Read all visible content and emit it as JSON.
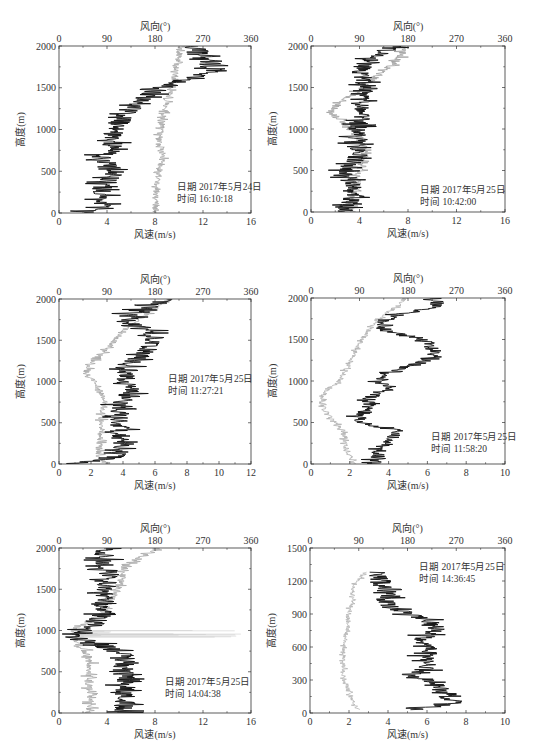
{
  "chart_data": [
    {
      "type": "line",
      "panel": 1,
      "title": "",
      "annotation": {
        "date": "日期 2017年5月24日",
        "time": "时间 16:10:18"
      },
      "xlabel": "风速(m/s)",
      "x2label": "风向(°)",
      "ylabel": "高度(m)",
      "xlim": [
        0,
        16
      ],
      "xticks": [
        0,
        4,
        8,
        12,
        16
      ],
      "x2lim": [
        0,
        360
      ],
      "x2ticks": [
        0,
        90,
        180,
        270,
        360
      ],
      "ylim": [
        0,
        2000
      ],
      "yticks": [
        0,
        500,
        1000,
        1500,
        2000
      ],
      "series": [
        {
          "name": "风速",
          "color": "#111111",
          "axis": "bottom",
          "heights": [
            0,
            100,
            200,
            300,
            400,
            500,
            600,
            700,
            800,
            900,
            1000,
            1100,
            1200,
            1300,
            1400,
            1500,
            1600,
            1700,
            1800,
            1900,
            2000
          ],
          "values": [
            2,
            3.8,
            3.8,
            3.6,
            4.2,
            4.6,
            4.0,
            3.8,
            4.4,
            4.6,
            4.6,
            5.2,
            5.8,
            6.2,
            7.2,
            8.6,
            10.5,
            12.8,
            13.0,
            12.0,
            11.0
          ],
          "noise": 1.1
        },
        {
          "name": "风向",
          "color": "#a8a8a8",
          "axis": "top",
          "heights": [
            0,
            100,
            200,
            300,
            400,
            500,
            600,
            700,
            800,
            900,
            1000,
            1100,
            1200,
            1300,
            1400,
            1500,
            1600,
            1700,
            1800,
            1900,
            2000
          ],
          "values": [
            180,
            180,
            182,
            184,
            185,
            188,
            192,
            195,
            190,
            188,
            190,
            195,
            198,
            200,
            205,
            210,
            215,
            218,
            220,
            225,
            225
          ],
          "noise": 8
        }
      ],
      "annotation_position": {
        "x": 9.8,
        "y": 280
      }
    },
    {
      "type": "line",
      "panel": 2,
      "annotation": {
        "date": "日期 2017年5月25日",
        "time": "时间 10:42:00"
      },
      "xlabel": "风速(m/s)",
      "x2label": "风向(°)",
      "ylabel": "高度(m)",
      "xlim": [
        0,
        16
      ],
      "xticks": [
        0,
        4,
        8,
        12,
        16
      ],
      "x2lim": [
        0,
        360
      ],
      "x2ticks": [
        0,
        90,
        180,
        270,
        360
      ],
      "ylim": [
        0,
        2000
      ],
      "yticks": [
        0,
        500,
        1000,
        1500,
        2000
      ],
      "series": [
        {
          "name": "风速",
          "color": "#111111",
          "axis": "bottom",
          "heights": [
            0,
            100,
            200,
            300,
            400,
            500,
            600,
            700,
            800,
            900,
            1000,
            1100,
            1200,
            1300,
            1400,
            1500,
            1600,
            1700,
            1800,
            1900,
            2000
          ],
          "values": [
            3,
            3,
            3.5,
            3.8,
            3.0,
            3.0,
            3.5,
            4.0,
            3.6,
            3.6,
            3.8,
            4.0,
            4.5,
            4.0,
            4.0,
            4.2,
            4.4,
            4.0,
            4.5,
            5.5,
            7.0
          ],
          "noise": 1.0
        },
        {
          "name": "风向",
          "color": "#a0a0a0",
          "axis": "top",
          "heights": [
            0,
            100,
            200,
            300,
            400,
            500,
            600,
            700,
            800,
            900,
            1000,
            1100,
            1200,
            1300,
            1400,
            1500,
            1600,
            1700,
            1800,
            1900,
            2000
          ],
          "values": [
            80,
            70,
            75,
            85,
            85,
            90,
            100,
            100,
            95,
            90,
            75,
            55,
            35,
            50,
            75,
            95,
            115,
            135,
            155,
            170,
            170
          ],
          "noise": 10
        }
      ],
      "annotation_position": {
        "x": 9.0,
        "y": 230
      }
    },
    {
      "type": "line",
      "panel": 3,
      "annotation": {
        "date": "日期 2017年5月25日",
        "time": "时间 11:27:21"
      },
      "xlabel": "风速(m/s)",
      "x2label": "风向(°)",
      "ylabel": "高度(m)",
      "xlim": [
        0,
        12
      ],
      "xticks": [
        0,
        2,
        4,
        6,
        8,
        10,
        12
      ],
      "x2lim": [
        0,
        360
      ],
      "x2ticks": [
        0,
        90,
        180,
        270,
        360
      ],
      "ylim": [
        0,
        2000
      ],
      "yticks": [
        0,
        500,
        1000,
        1500,
        2000
      ],
      "series": [
        {
          "name": "风速",
          "color": "#111111",
          "axis": "bottom",
          "heights": [
            0,
            100,
            200,
            300,
            400,
            500,
            600,
            700,
            800,
            900,
            1000,
            1100,
            1200,
            1300,
            1400,
            1500,
            1600,
            1700,
            1800,
            1900,
            2000
          ],
          "values": [
            1.2,
            3.8,
            3.8,
            3.8,
            3.8,
            3.8,
            3.8,
            3.6,
            4.2,
            4.4,
            4.2,
            4.2,
            4.4,
            5.0,
            5.6,
            6.0,
            5.8,
            4.8,
            4.2,
            5.5,
            7.0
          ],
          "noise": 0.8
        },
        {
          "name": "风向",
          "color": "#a8a8a8",
          "axis": "top",
          "heights": [
            0,
            100,
            200,
            300,
            400,
            500,
            600,
            700,
            800,
            900,
            1000,
            1100,
            1200,
            1300,
            1400,
            1500,
            1600,
            1700,
            1800,
            1900,
            2000
          ],
          "values": [
            85,
            75,
            75,
            78,
            78,
            80,
            80,
            85,
            85,
            75,
            65,
            50,
            60,
            75,
            90,
            105,
            120,
            140,
            160,
            185,
            210
          ],
          "noise": 8
        }
      ],
      "annotation_position": {
        "x": 6.8,
        "y": 1000
      }
    },
    {
      "type": "line",
      "panel": 4,
      "annotation": {
        "date": "日期 2017年5月25日",
        "time": "时间 11:58:20"
      },
      "xlabel": "风速(m/s)",
      "x2label": "风向(°)",
      "ylabel": "高度(m)",
      "xlim": [
        0,
        10
      ],
      "xticks": [
        0,
        2,
        4,
        6,
        8,
        10
      ],
      "x2lim": [
        0,
        360
      ],
      "x2ticks": [
        0,
        90,
        180,
        270,
        360
      ],
      "ylim": [
        0,
        2000
      ],
      "yticks": [
        0,
        500,
        1000,
        1500,
        2000
      ],
      "series": [
        {
          "name": "风速",
          "color": "#111111",
          "axis": "bottom",
          "heights": [
            0,
            100,
            200,
            300,
            400,
            500,
            600,
            700,
            800,
            900,
            1000,
            1100,
            1200,
            1300,
            1400,
            1500,
            1600,
            1700,
            1800,
            1900,
            2000
          ],
          "values": [
            3.0,
            3.5,
            3.6,
            4.2,
            4.5,
            2.5,
            2.5,
            3.0,
            3.0,
            4.0,
            3.6,
            3.8,
            5.5,
            6.4,
            6.2,
            6.0,
            3.8,
            3.6,
            4.5,
            6.5,
            6.5
          ],
          "noise": 0.45
        },
        {
          "name": "风向",
          "color": "#b0b0b0",
          "axis": "top",
          "heights": [
            0,
            100,
            200,
            300,
            400,
            500,
            600,
            700,
            800,
            900,
            1000,
            1100,
            1200,
            1300,
            1400,
            1500,
            1600,
            1700,
            1800,
            1900,
            2000
          ],
          "values": [
            80,
            72,
            65,
            62,
            60,
            45,
            30,
            20,
            20,
            30,
            55,
            60,
            70,
            80,
            85,
            95,
            105,
            120,
            135,
            160,
            175
          ],
          "noise": 6
        }
      ],
      "annotation_position": {
        "x": 6.2,
        "y": 290
      }
    },
    {
      "type": "line",
      "panel": 5,
      "annotation": {
        "date": "日期  2017年5月25日",
        "time": "时间 14:04:38"
      },
      "xlabel": "风速(m/s)",
      "x2label": "风向(°)",
      "ylabel": "高度(m)",
      "xlim": [
        0,
        16
      ],
      "xticks": [
        0,
        4,
        8,
        12,
        16
      ],
      "x2lim": [
        0,
        360
      ],
      "x2ticks": [
        0,
        90,
        180,
        270,
        360
      ],
      "ylim": [
        0,
        2000
      ],
      "yticks": [
        0,
        500,
        1000,
        1500,
        2000
      ],
      "series": [
        {
          "name": "风速",
          "color": "#111111",
          "axis": "bottom",
          "heights": [
            0,
            100,
            200,
            300,
            400,
            500,
            600,
            700,
            800,
            900,
            1000,
            1100,
            1200,
            1300,
            1400,
            1500,
            1600,
            1700,
            1800,
            1900,
            2000
          ],
          "values": [
            5.5,
            5.5,
            5.5,
            5.6,
            5.5,
            5.2,
            5.5,
            5.4,
            4.0,
            2.0,
            2.0,
            3.2,
            3.6,
            3.4,
            3.6,
            3.8,
            4.0,
            4.2,
            3.8,
            3.6,
            4.0
          ],
          "noise": 1.1
        },
        {
          "name": "风向",
          "color": "#aaaaaa",
          "axis": "top",
          "heights": [
            0,
            100,
            200,
            300,
            400,
            500,
            600,
            700,
            800,
            900,
            1000,
            1100,
            1200,
            1300,
            1400,
            1500,
            1600,
            1700,
            1800,
            1900,
            2000
          ],
          "values": [
            60,
            58,
            58,
            55,
            55,
            58,
            60,
            55,
            45,
            30,
            25,
            55,
            80,
            90,
            100,
            110,
            115,
            120,
            125,
            160,
            185
          ],
          "noise": 10
        },
        {
          "name": "风向-尖峰",
          "color": "#cfcfcf",
          "axis": "top",
          "spike": {
            "height_from": 920,
            "height_to": 1000,
            "max": 350
          }
        }
      ],
      "annotation_position": {
        "x": 8.8,
        "y": 340
      }
    },
    {
      "type": "line",
      "panel": 6,
      "annotation": {
        "date": "日期 2017年5月25日",
        "time": "时间 14:36:45"
      },
      "xlabel": "风速(m/s)",
      "x2label": "风向(°)",
      "ylabel": "高度(m)",
      "xlim": [
        0,
        10
      ],
      "xticks": [
        0,
        2,
        4,
        6,
        8,
        10
      ],
      "x2lim": [
        0,
        360
      ],
      "x2ticks": [
        0,
        90,
        180,
        270,
        360
      ],
      "ylim": [
        0,
        1500
      ],
      "yticks": [
        0,
        300,
        600,
        900,
        1200,
        1500
      ],
      "series": [
        {
          "name": "风速",
          "color": "#111111",
          "axis": "bottom",
          "heights": [
            30,
            100,
            160,
            220,
            280,
            340,
            400,
            460,
            520,
            580,
            640,
            700,
            760,
            820,
            880,
            940,
            1000,
            1060,
            1120,
            1180,
            1240,
            1280
          ],
          "values": [
            5.5,
            7.5,
            7.0,
            6.5,
            6.5,
            5.0,
            6.0,
            6.0,
            6.0,
            6.0,
            5.5,
            6.0,
            6.5,
            6.0,
            5.5,
            4.2,
            4.0,
            3.8,
            4.0,
            3.6,
            3.6,
            3.4
          ],
          "noise": 0.7
        },
        {
          "name": "风向",
          "color": "#b5b5b5",
          "axis": "top",
          "heights": [
            30,
            100,
            160,
            220,
            280,
            340,
            400,
            460,
            520,
            580,
            640,
            700,
            760,
            820,
            880,
            940,
            1000,
            1060,
            1120,
            1180,
            1240,
            1280
          ],
          "values": [
            90,
            80,
            75,
            70,
            65,
            62,
            62,
            62,
            62,
            62,
            65,
            65,
            70,
            70,
            70,
            72,
            80,
            80,
            78,
            85,
            95,
            105
          ],
          "noise": 5
        }
      ],
      "annotation_position": {
        "x": 5.6,
        "y": 1300
      }
    }
  ],
  "panels_layout": [
    {
      "left": 59,
      "top": 46,
      "right": 251,
      "bottom": 213
    },
    {
      "left": 311,
      "top": 46,
      "right": 505,
      "bottom": 212
    },
    {
      "left": 59,
      "top": 299,
      "right": 251,
      "bottom": 464
    },
    {
      "left": 311,
      "top": 298,
      "right": 505,
      "bottom": 464
    },
    {
      "left": 59,
      "top": 548,
      "right": 251,
      "bottom": 713
    },
    {
      "left": 310,
      "top": 548,
      "right": 505,
      "bottom": 713
    }
  ]
}
